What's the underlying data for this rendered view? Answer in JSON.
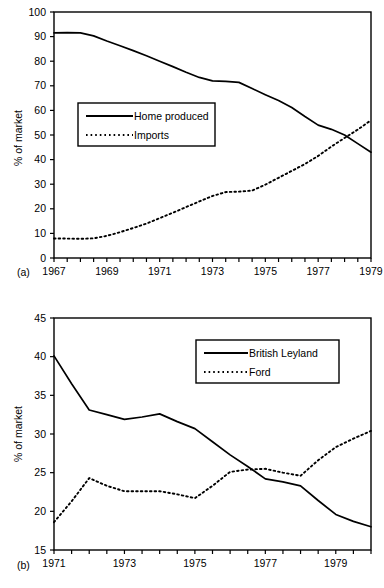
{
  "chart_data": [
    {
      "type": "line",
      "panel": "(a)",
      "title": "",
      "xlabel": "",
      "ylabel": "% of market",
      "xlim": [
        1967,
        1979
      ],
      "ylim": [
        0,
        100
      ],
      "grid": false,
      "legend_position": "inside-left",
      "xticks": [
        1967,
        1967.5,
        1968,
        1968.5,
        1969,
        1969.5,
        1970,
        1970.5,
        1971,
        1971.5,
        1972,
        1972.5,
        1973,
        1973.5,
        1974,
        1974.5,
        1975,
        1975.5,
        1976,
        1976.5,
        1977,
        1977.5,
        1978,
        1978.5,
        1979
      ],
      "xtick_labels": [
        "1967",
        "",
        "",
        "",
        "1969",
        "",
        "",
        "",
        "1971",
        "",
        "",
        "",
        "1973",
        "",
        "",
        "",
        "1975",
        "",
        "",
        "",
        "1977",
        "",
        "",
        "",
        "1979"
      ],
      "yticks": [
        0,
        10,
        20,
        30,
        40,
        50,
        60,
        70,
        80,
        90,
        100
      ],
      "ytick_labels": [
        "0",
        "10",
        "20",
        "30",
        "40",
        "50",
        "60",
        "70",
        "80",
        "90",
        "100"
      ],
      "x": [
        1967,
        1967.5,
        1968,
        1968.5,
        1969,
        1969.5,
        1970,
        1970.5,
        1971,
        1971.5,
        1972,
        1972.5,
        1973,
        1973.5,
        1974,
        1974.5,
        1975,
        1975.5,
        1976,
        1976.5,
        1977,
        1977.5,
        1978,
        1978.5,
        1979
      ],
      "series": [
        {
          "name": "Home produced",
          "style": "solid",
          "values": [
            91.5,
            91.6,
            91.5,
            90.3,
            88.2,
            86.3,
            84.3,
            82.2,
            80.0,
            77.8,
            75.5,
            73.4,
            72.0,
            71.8,
            71.4,
            68.9,
            66.4,
            64.0,
            61.2,
            57.5,
            54.0,
            52.3,
            50.0,
            46.5,
            43.0
          ]
        },
        {
          "name": "Imports",
          "style": "dotted",
          "values": [
            7.9,
            7.9,
            7.8,
            8.0,
            9.0,
            10.5,
            12.2,
            14.0,
            16.2,
            18.4,
            20.7,
            23.0,
            25.2,
            26.8,
            27.0,
            27.4,
            29.8,
            32.6,
            35.4,
            38.2,
            41.5,
            45.3,
            48.8,
            52.2,
            56.0
          ]
        }
      ]
    },
    {
      "type": "line",
      "panel": "(b)",
      "title": "",
      "xlabel": "",
      "ylabel": "% of market",
      "xlim": [
        1971,
        1980
      ],
      "ylim": [
        15,
        45
      ],
      "grid": false,
      "legend_position": "inside-right",
      "xticks": [
        1971,
        1971.5,
        1972,
        1972.5,
        1973,
        1973.5,
        1974,
        1974.5,
        1975,
        1975.5,
        1976,
        1976.5,
        1977,
        1977.5,
        1978,
        1978.5,
        1979,
        1979.5,
        1980
      ],
      "xtick_labels": [
        "1971",
        "",
        "",
        "",
        "1973",
        "",
        "",
        "",
        "1975",
        "",
        "",
        "",
        "1977",
        "",
        "",
        "",
        "1979",
        "",
        ""
      ],
      "yticks": [
        15,
        20,
        25,
        30,
        35,
        40,
        45
      ],
      "ytick_labels": [
        "15",
        "20",
        "25",
        "30",
        "35",
        "40",
        "45"
      ],
      "x": [
        1971,
        1971.5,
        1972,
        1972.5,
        1973,
        1973.5,
        1974,
        1974.5,
        1975,
        1975.5,
        1976,
        1976.5,
        1977,
        1977.5,
        1978,
        1978.5,
        1979,
        1979.5,
        1980
      ],
      "series": [
        {
          "name": "British Leyland",
          "style": "solid",
          "values": [
            40.1,
            36.5,
            33.1,
            32.5,
            31.9,
            32.2,
            32.6,
            31.6,
            30.7,
            29.0,
            27.3,
            25.8,
            24.2,
            23.8,
            23.3,
            21.4,
            19.6,
            18.7,
            18.0
          ]
        },
        {
          "name": "Ford",
          "style": "dotted",
          "values": [
            18.6,
            21.3,
            24.3,
            23.3,
            22.6,
            22.6,
            22.6,
            22.2,
            21.7,
            23.3,
            25.1,
            25.4,
            25.5,
            25.0,
            24.6,
            26.6,
            28.3,
            29.4,
            30.4
          ]
        }
      ]
    }
  ],
  "panels": {
    "a": {
      "label": "(a)",
      "ylabel": "% of market",
      "legend": {
        "solid_label": "Home produced",
        "dotted_label": "Imports"
      }
    },
    "b": {
      "label": "(b)",
      "ylabel": "% of market",
      "legend": {
        "solid_label": "British Leyland",
        "dotted_label": "Ford"
      }
    }
  },
  "colors": {
    "line": "#000000",
    "background": "#ffffff",
    "axis": "#000000"
  }
}
